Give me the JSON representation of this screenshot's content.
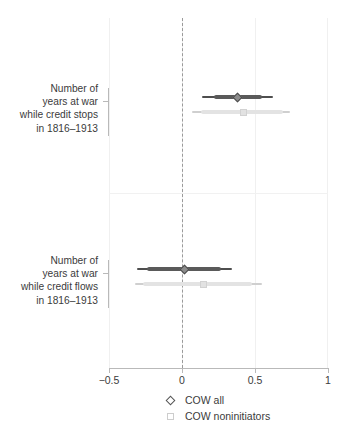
{
  "chart_data": {
    "type": "scatter",
    "subtype": "coefficient-plot",
    "title": "",
    "xlabel": "",
    "ylabel": "",
    "xlim": [
      -0.5,
      1
    ],
    "xticks": [
      -0.5,
      0,
      0.5,
      1
    ],
    "xtick_labels": [
      "−0.5",
      "0",
      "0.5",
      "1"
    ],
    "grid": true,
    "reference_line": {
      "value": 0,
      "style": "dashed",
      "color": "#9a9a9a"
    },
    "legend": {
      "position": "bottom",
      "entries": [
        {
          "name": "COW all",
          "marker": "diamond",
          "color": "#4e4e4e"
        },
        {
          "name": "COW noninitiators",
          "marker": "square",
          "color": "#d2d2d2"
        }
      ]
    },
    "categories": [
      "Number of years at war while credit stops in 1816–1913",
      "Number of years at war while credit flows in 1816–1913"
    ],
    "series": [
      {
        "name": "COW all",
        "marker": "diamond",
        "color": "#4e4e4e",
        "estimates": [
          0.38,
          0.02
        ],
        "ci_inner": [
          [
            0.22,
            0.55
          ],
          [
            -0.24,
            0.27
          ]
        ],
        "ci_outer": [
          [
            0.14,
            0.62
          ],
          [
            -0.31,
            0.34
          ]
        ]
      },
      {
        "name": "COW noninitiators",
        "marker": "square",
        "color": "#d2d2d2",
        "estimates": [
          0.42,
          0.15
        ],
        "ci_inner": [
          [
            0.13,
            0.69
          ],
          [
            -0.27,
            0.48
          ]
        ],
        "ci_outer": [
          [
            0.07,
            0.74
          ],
          [
            -0.32,
            0.55
          ]
        ]
      }
    ]
  },
  "axis": {
    "ticks": [
      {
        "value": -0.5,
        "label": "−0.5"
      },
      {
        "value": 0,
        "label": "0"
      },
      {
        "value": 0.5,
        "label": "0.5"
      },
      {
        "value": 1,
        "label": "1"
      }
    ]
  },
  "categories": [
    {
      "lines": [
        "Number of",
        "years at war",
        "while credit stops",
        "in 1816–1913"
      ]
    },
    {
      "lines": [
        "Number of",
        "years at war",
        "while credit flows",
        "in 1816–1913"
      ]
    }
  ],
  "legend": {
    "items": [
      {
        "label": "COW all",
        "marker": "diamond-icon"
      },
      {
        "label": "COW noninitiators",
        "marker": "square-icon"
      }
    ]
  }
}
